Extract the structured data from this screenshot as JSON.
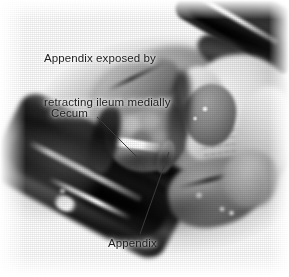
{
  "figure": {
    "kind": "surgical-photograph",
    "modality": "grayscale",
    "width_px": 289,
    "height_px": 277,
    "background_color": "#ffffff",
    "ink_color": "#1c1c1c"
  },
  "caption": {
    "line1": "Appendix exposed by",
    "line2": "retracting ileum medially",
    "full_text": "Appendix exposed by retracting ileum medially"
  },
  "labels": [
    {
      "id": "cecum",
      "text": "Cecum"
    },
    {
      "id": "appendix",
      "text": "Appendix"
    }
  ],
  "leader_lines": [
    {
      "id": "cecum-leader",
      "from": [
        97,
        117
      ],
      "to": [
        137,
        157
      ],
      "color": "#3a3a3a"
    },
    {
      "id": "appendix-leader",
      "from": [
        140,
        234
      ],
      "to": [
        169,
        152
      ],
      "color": "#3a3a3a"
    }
  ],
  "anatomy": [
    {
      "id": "upper-retractor-blade",
      "label": "retractor blade (superior)"
    },
    {
      "id": "lower-retractor-blade",
      "label": "retractor blade (inferior)"
    },
    {
      "id": "cecum-mass",
      "label": "cecum"
    },
    {
      "id": "appendix-structure",
      "label": "appendix"
    },
    {
      "id": "gloved-hand",
      "label": "surgeon gloved hand"
    },
    {
      "id": "bowel-loops",
      "label": "small bowel / ileum loops"
    },
    {
      "id": "abdominal-wall",
      "label": "abdominal wall incision edge"
    }
  ]
}
